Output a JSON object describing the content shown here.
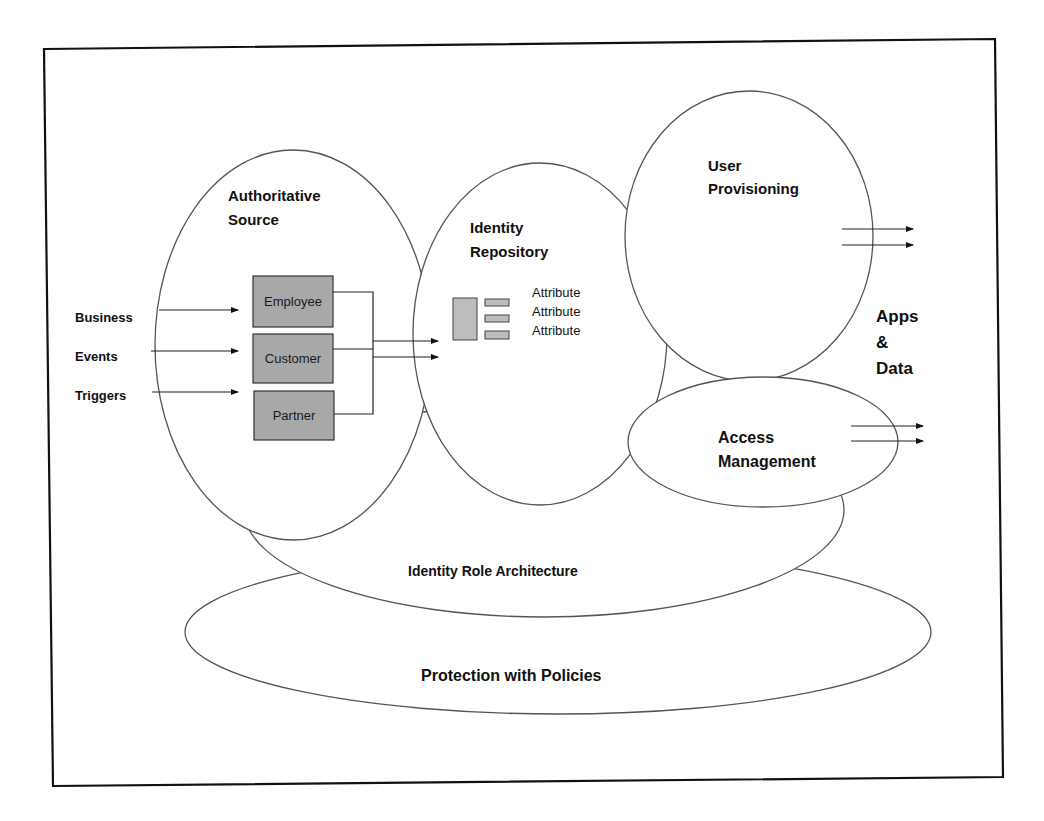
{
  "diagram": {
    "components": {
      "authoritative_source": {
        "line1": "Authoritative",
        "line2": "Source"
      },
      "identity_repository": {
        "line1": "Identity",
        "line2": "Repository"
      },
      "user_provisioning": {
        "line1": "User",
        "line2": "Provisioning"
      },
      "access_management": {
        "line1": "Access",
        "line2": "Management"
      },
      "identity_role_architecture": {
        "label": "Identity Role Architecture"
      },
      "protection_with_policies": {
        "label": "Protection with Policies"
      }
    },
    "inputs": [
      "Business",
      "Events",
      "Triggers"
    ],
    "sources": [
      "Employee",
      "Customer",
      "Partner"
    ],
    "attributes": [
      "Attribute",
      "Attribute",
      "Attribute"
    ],
    "output": {
      "line1": "Apps",
      "line2": "&",
      "line3": "Data"
    },
    "colors": {
      "box_fill": "#a8a8a8",
      "attribute_fill": "#bdbdbd",
      "line": "#222222",
      "background": "#ffffff"
    }
  }
}
